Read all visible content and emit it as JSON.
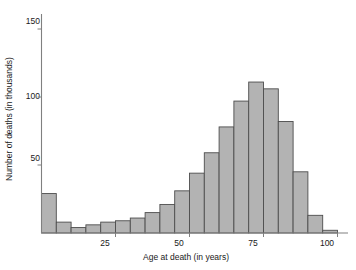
{
  "chart_data": {
    "type": "bar",
    "title": "",
    "xlabel": "Age at death (in years)",
    "ylabel": "Number of deaths (in thousands)",
    "xlim": [
      0,
      104
    ],
    "ylim": [
      0,
      162
    ],
    "xticks": [
      25,
      50,
      75,
      100
    ],
    "xtick_labels": [
      "25",
      "50",
      "75",
      "100"
    ],
    "yticks": [
      50,
      100,
      150
    ],
    "ytick_labels": [
      "50",
      "100",
      "150"
    ],
    "grid": false,
    "legend": false,
    "bin_width": 5,
    "bin_starts": [
      0,
      5,
      10,
      15,
      20,
      25,
      30,
      35,
      40,
      45,
      50,
      55,
      60,
      65,
      70,
      75,
      80,
      85,
      90,
      95
    ],
    "categories": [
      "0-5",
      "5-10",
      "10-15",
      "15-20",
      "20-25",
      "25-30",
      "30-35",
      "35-40",
      "40-45",
      "45-50",
      "50-55",
      "55-60",
      "60-65",
      "65-70",
      "70-75",
      "75-80",
      "80-85",
      "85-90",
      "90-95",
      "95-100"
    ],
    "values": [
      29,
      8,
      4,
      6,
      8,
      9,
      11,
      15,
      21,
      31,
      44,
      59,
      78,
      97,
      111,
      106,
      82,
      45,
      13,
      2
    ],
    "bar_fill": "#b3b3b3",
    "bar_stroke": "#4d4d4d",
    "axis_color": "#808080"
  },
  "axes": {
    "ylabel": "Number of deaths (in thousands)",
    "xlabel": "Age at death (in years)",
    "ytick_labels": [
      "150",
      "100",
      "50"
    ],
    "xtick_labels": [
      "25",
      "50",
      "75",
      "100"
    ]
  }
}
